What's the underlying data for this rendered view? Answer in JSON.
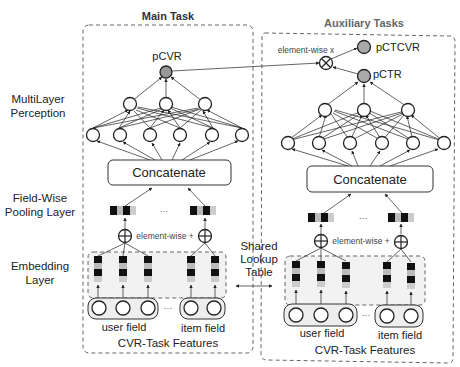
{
  "main_task": {
    "title": "Main Task",
    "output_label": "pCVR",
    "concat_label": "Concatenate",
    "elementwise_plus_label": "element-wise +",
    "ellipsis": "···",
    "user_field_label": "user field",
    "item_field_label": "item field",
    "features_label": "CVR-Task Features"
  },
  "aux_task": {
    "title": "Auxiliary Tasks",
    "ctcvr_label": "pCTCVR",
    "ctr_label": "pCTR",
    "elementwise_x_label": "element-wise x",
    "concat_label": "Concatenate",
    "elementwise_plus_label": "element-wise +",
    "ellipsis": "···",
    "user_field_label": "user field",
    "item_field_label": "item field",
    "features_label": "CVR-Task Features"
  },
  "side_labels": {
    "mlp_line1": "MultiLayer",
    "mlp_line2": "Perception",
    "pool_line1": "Field-Wise",
    "pool_line2": "Pooling Layer",
    "emb_line1": "Embedding",
    "emb_line2": "Layer"
  },
  "shared": {
    "line1": "Shared",
    "line2": "Lookup",
    "line3": "Table"
  },
  "colors": {
    "output_node": "#999999",
    "embedding_dark": "#111111",
    "embedding_light": "#bbbbbb"
  }
}
